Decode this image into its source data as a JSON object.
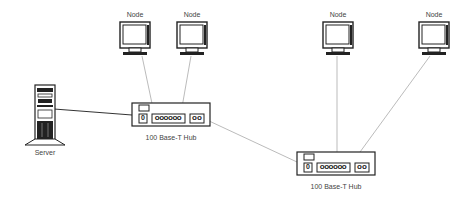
{
  "diagram": {
    "nodes": [
      {
        "id": "node1",
        "label": "Node",
        "x": 135,
        "y": 15
      },
      {
        "id": "node2",
        "label": "Node",
        "x": 192,
        "y": 15
      },
      {
        "id": "node3",
        "label": "Node",
        "x": 338,
        "y": 15
      },
      {
        "id": "node4",
        "label": "Node",
        "x": 434,
        "y": 15
      }
    ],
    "server": {
      "label": "Server"
    },
    "hubs": [
      {
        "id": "hub1",
        "label": "100 Base-T Hub",
        "ports_main": "oooooo",
        "port_single": "0",
        "ports_uplink": "oo"
      },
      {
        "id": "hub2",
        "label": "100 Base-T Hub",
        "ports_main": "oooooo",
        "port_single": "0",
        "ports_uplink": "oo"
      }
    ],
    "colors": {
      "line": "#999999",
      "server_line": "#333333",
      "stroke": "#222222"
    }
  }
}
